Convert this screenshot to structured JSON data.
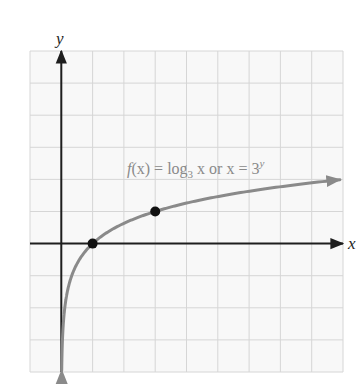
{
  "chart_data": {
    "type": "line",
    "title": "",
    "xlabel": "x",
    "ylabel": "y",
    "xlim": [
      -1,
      9
    ],
    "ylim": [
      -4,
      6
    ],
    "grid": true,
    "grid_spacing": 1,
    "series": [
      {
        "name": "f(x) = log_3 x or x = 3^y",
        "function": "log3(x)",
        "x": [
          0.02,
          0.05,
          0.1,
          0.2,
          0.333,
          0.5,
          1,
          2,
          3,
          4,
          5,
          6,
          7,
          8,
          8.9
        ],
        "values": [
          -3.56,
          -2.73,
          -2.1,
          -1.46,
          -1.0,
          -0.63,
          0,
          0.63,
          1,
          1.26,
          1.46,
          1.63,
          1.77,
          1.89,
          1.99
        ],
        "color": "#8a8a8a"
      }
    ],
    "highlighted_points": [
      {
        "x": 1,
        "y": 0
      },
      {
        "x": 3,
        "y": 1
      }
    ],
    "annotations": [
      {
        "text": "f(x) = log₃ x or x = 3ʸ",
        "x": 2.1,
        "y": 2.3
      }
    ]
  },
  "labels": {
    "x_axis": "x",
    "y_axis": "y",
    "fx": "f",
    "fx_arg": "(x) = log",
    "fx_base": "3",
    "fx_rest": " x or x = 3",
    "fx_exp": "y"
  },
  "colors": {
    "grid": "#d6d6d6",
    "background": "#f8f8f8",
    "axis": "#1e1e1e",
    "curve": "#8a8a8a",
    "point": "#111111",
    "annotation": "#8a8a8a"
  }
}
